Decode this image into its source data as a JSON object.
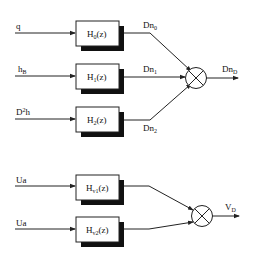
{
  "diagram": {
    "type": "block-diagram",
    "top_group": {
      "inputs": [
        {
          "label": "q",
          "sup": "",
          "sub": ""
        },
        {
          "label": "h",
          "sup": "",
          "sub": "B"
        },
        {
          "label": "D",
          "sup": "2",
          "sub": "",
          "tail": "h"
        }
      ],
      "blocks": [
        {
          "name": "H",
          "sub": "0",
          "arg": "(z)"
        },
        {
          "name": "H",
          "sub": "1",
          "arg": "(z)"
        },
        {
          "name": "H",
          "sub": "2",
          "arg": "(z)"
        }
      ],
      "signals": [
        {
          "name": "Dn",
          "sub": "0"
        },
        {
          "name": "Dn",
          "sub": "1"
        },
        {
          "name": "Dn",
          "sub": "2"
        }
      ],
      "junction": "multiplier",
      "output": {
        "name": "Dn",
        "sub": "D"
      }
    },
    "bottom_group": {
      "inputs": [
        {
          "label": "Ua"
        },
        {
          "label": "Ua"
        }
      ],
      "blocks": [
        {
          "name": "H",
          "sub": "v1",
          "arg": "(z)"
        },
        {
          "name": "H",
          "sub": "v2",
          "arg": "(z)"
        }
      ],
      "junction": "multiplier",
      "output": {
        "name": "V",
        "sub": "D"
      }
    },
    "colors": {
      "line": "#222222",
      "shadow": "#111111",
      "box_fill": "#ffffff"
    }
  }
}
